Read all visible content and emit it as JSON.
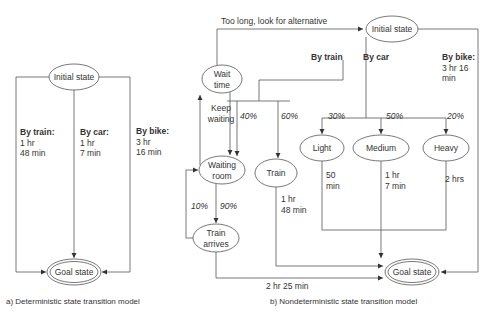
{
  "diagram_a": {
    "caption": "a) Deterministic state transition model",
    "initial_state": "Initial state",
    "goal_state": "Goal state",
    "transitions": [
      {
        "mode": "By train:",
        "time1": "1 hr",
        "time2": "48 min"
      },
      {
        "mode": "By car:",
        "time1": "1 hr",
        "time2": "7 min"
      },
      {
        "mode": "By bike:",
        "time1": "3 hr",
        "time2": "16 min"
      }
    ]
  },
  "diagram_b": {
    "caption": "b) Nondeterministic state transition model",
    "initial_state": "Initial state",
    "goal_state": "Goal state",
    "too_long_label": "Too long, look for alternative",
    "modes": {
      "train": "By train",
      "car": "By car",
      "bike": "By bike:",
      "bike_time1": "3 hr 16",
      "bike_time2": "min"
    },
    "nodes": {
      "wait_time1": "Wait",
      "wait_time2": "time",
      "waiting_room1": "Waiting",
      "waiting_room2": "room",
      "train": "Train",
      "train_arrives1": "Train",
      "train_arrives2": "arrives",
      "light": "Light",
      "medium": "Medium",
      "heavy": "Heavy"
    },
    "edges": {
      "keep_waiting1": "Keep",
      "keep_waiting2": "waiting",
      "p_waiting": "40%",
      "p_train": "60%",
      "p_ten": "10%",
      "p_ninety": "90%",
      "p_light": "30%",
      "p_medium": "50%",
      "p_heavy": "20%",
      "train_time1": "1 hr",
      "train_time2": "48 min",
      "light_time1": "50",
      "light_time2": "min",
      "medium_time1": "1 hr",
      "medium_time2": "7 min",
      "heavy_time": "2 hrs",
      "arrives_time": "2 hr 25 min"
    }
  }
}
